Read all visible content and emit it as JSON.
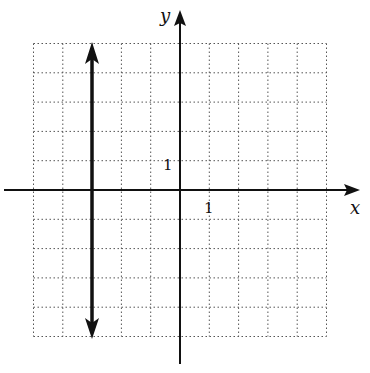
{
  "diagram": {
    "type": "coordinate-plane",
    "x_axis_label": "x",
    "y_axis_label": "y",
    "x_tick_label": "1",
    "y_tick_label": "1",
    "grid": {
      "x_range": [
        -5,
        5
      ],
      "y_range": [
        -5,
        5
      ],
      "style": "dotted"
    },
    "graphed_line": {
      "equation": "x = -3",
      "orientation": "vertical",
      "arrows": "both"
    },
    "colors": {
      "axis": "#111111",
      "grid": "#555555",
      "line": "#111111"
    }
  }
}
